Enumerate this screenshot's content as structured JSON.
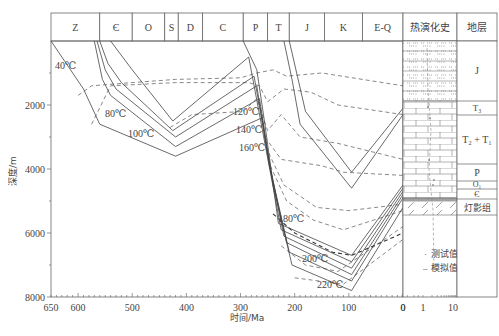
{
  "figure": {
    "x_axis_label": "时间/Ma",
    "y_axis_label": "深度/m",
    "x_ticks": [
      "650",
      "600",
      "500",
      "400",
      "300",
      "200",
      "100",
      "0"
    ],
    "y_ticks": [
      "2000",
      "4000",
      "6000",
      "8000"
    ],
    "ro_ticks": [
      "0",
      "1",
      "10"
    ],
    "periods": [
      "Z",
      "Є",
      "O",
      "S",
      "D",
      "C",
      "P",
      "T",
      "J",
      "K",
      "E-Q"
    ],
    "thermal_header": "热演化史",
    "strata_header": "地层",
    "strata": [
      "J",
      "T₃",
      "T₂ + T₁",
      "P",
      "O₁",
      "Є",
      "灯影组"
    ],
    "isotherms": [
      "40℃",
      "80℃",
      "100℃",
      "120℃",
      "140℃",
      "160℃",
      "180℃",
      "200℃",
      "220℃"
    ],
    "legend": [
      {
        "symbol": "·",
        "label": "测试值(R₀)"
      },
      {
        "symbol": "–",
        "label": "模拟值(R₀)"
      }
    ]
  },
  "chart_data": {
    "type": "line",
    "title": "",
    "xlabel": "时间/Ma",
    "ylabel": "深度/m",
    "xlim": [
      650,
      0
    ],
    "ylim": [
      0,
      8000
    ],
    "x_ticks": [
      650,
      600,
      500,
      400,
      300,
      200,
      100,
      0
    ],
    "y_ticks": [
      2000,
      4000,
      6000,
      8000
    ],
    "periods": [
      {
        "name": "Z",
        "start": 650,
        "end": 560
      },
      {
        "name": "Є",
        "start": 560,
        "end": 500
      },
      {
        "name": "O",
        "start": 500,
        "end": 440
      },
      {
        "name": "S",
        "start": 440,
        "end": 415
      },
      {
        "name": "D",
        "start": 415,
        "end": 370
      },
      {
        "name": "C",
        "start": 370,
        "end": 295
      },
      {
        "name": "P",
        "start": 295,
        "end": 250
      },
      {
        "name": "T",
        "start": 250,
        "end": 210
      },
      {
        "name": "J",
        "start": 210,
        "end": 145
      },
      {
        "name": "K",
        "start": 145,
        "end": 75
      },
      {
        "name": "E-Q",
        "start": 75,
        "end": 0
      }
    ],
    "burial_curves": [
      {
        "name": "Z-base",
        "points": [
          [
            650,
            0
          ],
          [
            590,
            1500
          ],
          [
            560,
            2600
          ],
          [
            420,
            3600
          ],
          [
            260,
            2400
          ],
          [
            240,
            4500
          ],
          [
            205,
            7000
          ],
          [
            95,
            7800
          ],
          [
            0,
            5200
          ]
        ]
      },
      {
        "name": "Є-base",
        "points": [
          [
            570,
            0
          ],
          [
            555,
            1200
          ],
          [
            540,
            1700
          ],
          [
            420,
            3300
          ],
          [
            265,
            1800
          ],
          [
            245,
            4000
          ],
          [
            210,
            6600
          ],
          [
            95,
            7500
          ],
          [
            0,
            4900
          ]
        ]
      },
      {
        "name": "Є-top",
        "points": [
          [
            565,
            0
          ],
          [
            550,
            900
          ],
          [
            530,
            1500
          ],
          [
            420,
            3000
          ],
          [
            270,
            1400
          ],
          [
            248,
            3800
          ],
          [
            215,
            6300
          ],
          [
            95,
            7300
          ],
          [
            0,
            4800
          ]
        ]
      },
      {
        "name": "O-top",
        "points": [
          [
            560,
            0
          ],
          [
            545,
            700
          ],
          [
            520,
            1300
          ],
          [
            425,
            2800
          ],
          [
            275,
            1100
          ],
          [
            250,
            3500
          ],
          [
            220,
            6100
          ],
          [
            95,
            7100
          ],
          [
            0,
            4700
          ]
        ]
      },
      {
        "name": "S-top",
        "points": [
          [
            540,
            0
          ],
          [
            500,
            900
          ],
          [
            425,
            2500
          ],
          [
            285,
            500
          ],
          [
            255,
            3200
          ],
          [
            225,
            5900
          ],
          [
            95,
            6900
          ],
          [
            0,
            4600
          ]
        ]
      },
      {
        "name": "C-top",
        "points": [
          [
            295,
            0
          ],
          [
            270,
            900
          ],
          [
            255,
            2600
          ],
          [
            230,
            5700
          ],
          [
            95,
            6700
          ],
          [
            0,
            4500
          ]
        ]
      },
      {
        "name": "T-top",
        "points": [
          [
            220,
            0
          ],
          [
            205,
            1200
          ],
          [
            190,
            2600
          ],
          [
            95,
            4600
          ],
          [
            0,
            2300
          ]
        ]
      },
      {
        "name": "J-top",
        "points": [
          [
            210,
            0
          ],
          [
            195,
            1100
          ],
          [
            180,
            2200
          ],
          [
            95,
            4100
          ],
          [
            0,
            2100
          ]
        ]
      }
    ],
    "isotherm_lines": [
      {
        "label": "40℃",
        "points": [
          [
            600,
            1700
          ],
          [
            575,
            1400
          ],
          [
            500,
            1300
          ],
          [
            420,
            1200
          ],
          [
            300,
            1150
          ],
          [
            270,
            1000
          ],
          [
            240,
            900
          ],
          [
            215,
            1100
          ],
          [
            150,
            1000
          ],
          [
            0,
            1400
          ]
        ]
      },
      {
        "label": "80℃",
        "points": [
          [
            575,
            2600
          ],
          [
            540,
            1400
          ],
          [
            420,
            1300
          ],
          [
            285,
            1300
          ],
          [
            265,
            1400
          ],
          [
            250,
            1900
          ],
          [
            220,
            1500
          ],
          [
            170,
            1600
          ],
          [
            120,
            2000
          ],
          [
            0,
            2300
          ]
        ]
      },
      {
        "label": "100℃",
        "points": [
          [
            430,
            2700
          ],
          [
            390,
            2300
          ],
          [
            295,
            2200
          ],
          [
            270,
            1800
          ],
          [
            250,
            2800
          ],
          [
            225,
            2300
          ],
          [
            190,
            3000
          ],
          [
            120,
            3200
          ],
          [
            0,
            3700
          ]
        ]
      },
      {
        "label": "120℃",
        "points": [
          [
            255,
            3000
          ],
          [
            225,
            3700
          ],
          [
            150,
            3900
          ],
          [
            110,
            4100
          ],
          [
            0,
            4200
          ]
        ]
      },
      {
        "label": "140℃",
        "points": [
          [
            248,
            3500
          ],
          [
            220,
            4500
          ],
          [
            160,
            5200
          ],
          [
            100,
            5300
          ],
          [
            0,
            5100
          ]
        ]
      },
      {
        "label": "160℃",
        "points": [
          [
            245,
            3900
          ],
          [
            215,
            5000
          ],
          [
            165,
            5600
          ],
          [
            110,
            5900
          ],
          [
            0,
            5300
          ]
        ]
      },
      {
        "label": "180℃",
        "points": [
          [
            240,
            5400
          ],
          [
            200,
            6000
          ],
          [
            130,
            6600
          ],
          [
            95,
            6700
          ],
          [
            0,
            6000
          ]
        ]
      },
      {
        "label": "200℃",
        "points": [
          [
            225,
            6400
          ],
          [
            180,
            7000
          ],
          [
            120,
            7200
          ],
          [
            0,
            5800
          ]
        ]
      },
      {
        "label": "220℃",
        "points": [
          [
            200,
            7400
          ],
          [
            110,
            7600
          ],
          [
            0,
            6200
          ]
        ]
      }
    ],
    "ro_axis": {
      "ticks": [
        0,
        1,
        10
      ],
      "scale": "log"
    },
    "legend": [
      "测试值(R₀)",
      "模拟值(R₀)"
    ]
  }
}
